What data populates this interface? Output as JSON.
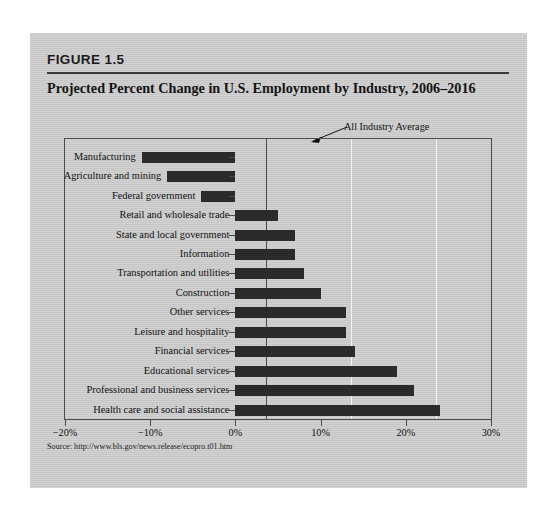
{
  "figure": {
    "label": "FIGURE 1.5",
    "title": "Projected Percent Change in U.S. Employment by Industry, 2006–2016",
    "source": "Source: http://www.bls.gov/news.release/ecopro.t01.htm",
    "annotation": "All Industry Average",
    "panel_color": "#c9c9c9",
    "bar_color": "#2b2b2b",
    "axis_color": "#4a4a4a"
  },
  "chart_data": {
    "type": "bar",
    "orientation": "horizontal",
    "title": "Projected Percent Change in U.S. Employment by Industry, 2006–2016",
    "xlabel": "",
    "ylabel": "",
    "xlim": [
      -20,
      30
    ],
    "xticks": [
      -20,
      -10,
      0,
      10,
      20,
      30
    ],
    "xtick_labels": [
      "−20%",
      "−10%",
      "0%",
      "10%",
      "20%",
      "30%"
    ],
    "grid": "vertical gridlines at 10% and 20%, solid axis line at 0%",
    "legend": "none",
    "annotations": [
      {
        "text": "All Industry Average",
        "points_to_x": 10,
        "note": "arrow pointing to the 10% reference line"
      }
    ],
    "categories": [
      "Manufacturing",
      "Agriculture and mining",
      "Federal government",
      "Retail and wholesale trade",
      "State and local government",
      "Information",
      "Transportation and utilities",
      "Construction",
      "Other services",
      "Leisure and hospitality",
      "Financial services",
      "Educational services",
      "Professional and business services",
      "Health care and social assistance"
    ],
    "values": [
      -11.0,
      -8.0,
      -4.0,
      5.0,
      7.0,
      7.0,
      8.0,
      10.0,
      13.0,
      13.0,
      14.0,
      19.0,
      21.0,
      24.0
    ],
    "units": "percent"
  }
}
